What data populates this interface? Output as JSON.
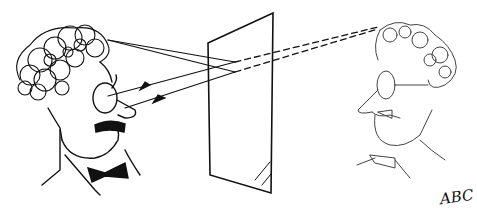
{
  "image": {
    "description": "Cartoon: a curly-haired man with glasses and mustache looks into a plane mirror; solid ray lines run from his head to the mirror and arrows return to his eye; dashed lines extend behind the mirror to his faint mirror image on the right.",
    "signature": "ABC",
    "colors": {
      "ink": "#111111",
      "faint_ink": "#555555",
      "background": "#ffffff"
    }
  }
}
